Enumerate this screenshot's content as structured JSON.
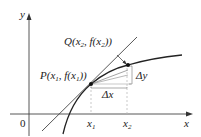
{
  "diagram": {
    "axes": {
      "x_label": "x",
      "y_label": "y",
      "origin_label": "0"
    },
    "points": {
      "P": {
        "name": "P",
        "x_var": "x",
        "x_sub": "1",
        "label": "P(x₁, f(x₁))"
      },
      "Q": {
        "name": "Q",
        "x_var": "x",
        "x_sub": "2",
        "label": "Q(x₂, f(x₂))"
      }
    },
    "ticks": {
      "x1": {
        "var": "x",
        "sub": "1"
      },
      "x2": {
        "var": "x",
        "sub": "2"
      }
    },
    "increments": {
      "dx": "Δx",
      "dy": "Δy"
    },
    "elements": [
      "curve y = f(x)",
      "secant line PQ",
      "tangent line at P"
    ],
    "colors": {
      "stroke": "#222222",
      "guide": "#bbbbbb",
      "background": "#ffffff"
    }
  }
}
